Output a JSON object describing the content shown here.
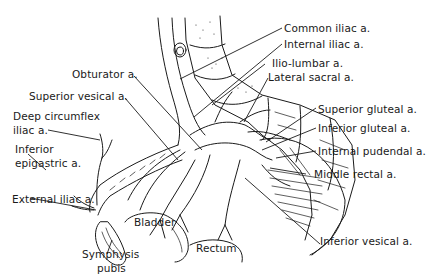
{
  "figure": {
    "ink_color": "#1a1a1a",
    "background": "#ffffff"
  },
  "labels": {
    "common_iliac": "Common iliac a.",
    "internal_iliac": "Internal iliac a.",
    "ilio_lumbar": "Ilio-lumbar a.",
    "lateral_sacral": "Lateral sacral a.",
    "obturator": "Obturator a.",
    "superior_vesical": "Superior vesical a.",
    "deep_circumflex_1": "Deep circumflex",
    "deep_circumflex_2": "iliac a.",
    "inferior_epigastric_1": "Inferior",
    "inferior_epigastric_2": "epigastric a.",
    "superior_gluteal": "Superior gluteal a.",
    "inferior_gluteal": "Inferior gluteal a.",
    "internal_pudendal": "Internal pudendal a.",
    "middle_rectal": "Middle rectal a.",
    "external_iliac": "External iliac a.",
    "bladder": "Bladder",
    "symphysis_1": "Symphysis",
    "symphysis_2": "pubis",
    "rectum": "Rectum",
    "inferior_vesical": "Inferior vesical a."
  }
}
